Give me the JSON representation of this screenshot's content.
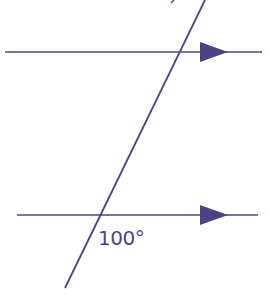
{
  "diagram": {
    "type": "parallel-lines-transversal",
    "stroke_color": "#4a4483",
    "background": "#ffffff",
    "parallel_lines": [
      {
        "name": "top",
        "x1": 5,
        "y1": 52,
        "x2": 262,
        "y2": 52,
        "arrow_x": 200
      },
      {
        "name": "bottom",
        "x1": 17,
        "y1": 215,
        "x2": 258,
        "y2": 215,
        "arrow_x": 200
      }
    ],
    "transversal": {
      "x1": 205,
      "y1": 0,
      "x2": 65,
      "y2": 288
    },
    "angle_label": "100°"
  }
}
